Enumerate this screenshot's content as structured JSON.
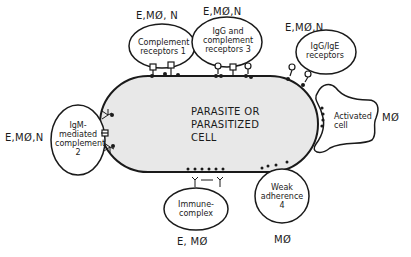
{
  "diagram": {
    "central": {
      "lines": [
        "PARASITE OR",
        "PARASITIZED",
        "CELL"
      ],
      "fill": "#e8e8e8"
    },
    "mechanisms": [
      {
        "id": 1,
        "lines": [
          "Complement",
          "receptors 1"
        ],
        "effector_cells": "E,MØ, N"
      },
      {
        "id": 2,
        "lines": [
          "IgM-",
          "mediated",
          "complement",
          "2"
        ],
        "effector_cells": "E,MØ,N"
      },
      {
        "id": 3,
        "lines": [
          "IgG and",
          "complement",
          "receptors 3"
        ],
        "effector_cells": "E,MØ,N"
      },
      {
        "id": "igg-ige",
        "lines": [
          "IgG/IgE",
          "receptors"
        ],
        "effector_cells": "E,MØ,N"
      },
      {
        "id": "activated",
        "lines": [
          "Activated",
          "cell"
        ],
        "effector_cells": "MØ"
      },
      {
        "id": "immune-complex",
        "lines": [
          "Immune-",
          "complex"
        ],
        "effector_cells": "E, MØ"
      },
      {
        "id": 4,
        "lines": [
          "Weak",
          "adherence",
          "4"
        ],
        "effector_cells": "MØ"
      }
    ]
  }
}
